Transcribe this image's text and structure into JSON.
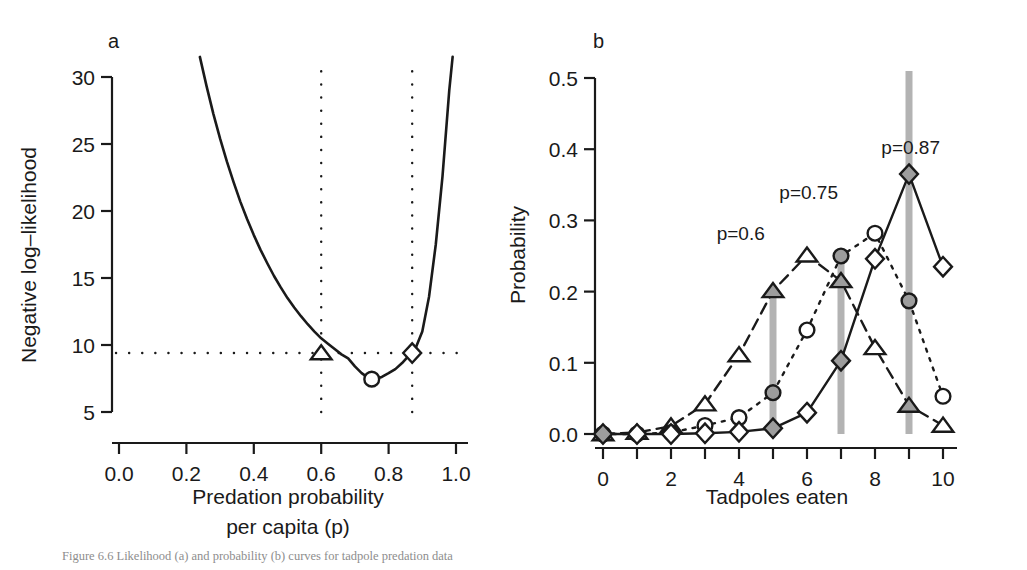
{
  "figure": {
    "caption": "Figure 6.6 Likelihood (a) and probability (b) curves for tadpole predation data",
    "panels": [
      "a",
      "b"
    ]
  },
  "panel_a": {
    "letter": "a",
    "ylabel": "Negative log–likelihood",
    "xlabel_line1": "Predation probability",
    "xlabel_line2": "per capita (p)",
    "xticks": [
      "0.0",
      "0.2",
      "0.4",
      "0.6",
      "0.8",
      "1.0"
    ],
    "yticks": [
      "5",
      "10",
      "15",
      "20",
      "25",
      "30"
    ]
  },
  "panel_b": {
    "letter": "b",
    "ylabel": "Probability",
    "xlabel": "Tadpoles eaten",
    "xticks": [
      "0",
      "1",
      "2",
      "3",
      "4",
      "5",
      "6",
      "7",
      "8",
      "9",
      "10"
    ],
    "xticks_labeled": [
      "0",
      "2",
      "4",
      "6",
      "8",
      "10"
    ],
    "yticks": [
      "0.0",
      "0.1",
      "0.2",
      "0.3",
      "0.4",
      "0.5"
    ],
    "annotations": [
      {
        "text": "p=0.6",
        "x": 4.05,
        "y": 0.272
      },
      {
        "text": "p=0.75",
        "x": 6.05,
        "y": 0.33
      },
      {
        "text": "p=0.87",
        "x": 9.05,
        "y": 0.393
      }
    ]
  },
  "chart_data": [
    {
      "type": "line",
      "id": "panel-a-likelihood-profile",
      "title": "a",
      "xlabel": "Predation probability per capita (p)",
      "ylabel": "Negative log-likelihood",
      "xlim": [
        0.0,
        1.0
      ],
      "ylim": [
        4.2,
        31.5
      ],
      "xticks": [
        0.0,
        0.2,
        0.4,
        0.6,
        0.8,
        1.0
      ],
      "yticks": [
        5,
        10,
        15,
        20,
        25,
        30
      ],
      "grid": false,
      "legend": "none",
      "curve": {
        "name": "Negative log-likelihood profile",
        "x": [
          0.24,
          0.26,
          0.28,
          0.3,
          0.32,
          0.34,
          0.36,
          0.38,
          0.4,
          0.42,
          0.44,
          0.46,
          0.48,
          0.5,
          0.52,
          0.54,
          0.56,
          0.58,
          0.6,
          0.62,
          0.64,
          0.66,
          0.68,
          0.7,
          0.72,
          0.74,
          0.75,
          0.76,
          0.78,
          0.8,
          0.82,
          0.84,
          0.86,
          0.87,
          0.88,
          0.9,
          0.92,
          0.94,
          0.96,
          0.98,
          0.99
        ],
        "y": [
          31.5,
          29.3,
          27.25,
          25.4,
          23.7,
          22.15,
          20.7,
          19.4,
          18.2,
          17.1,
          16.1,
          15.15,
          14.3,
          13.5,
          12.8,
          12.15,
          11.55,
          11.0,
          10.5,
          10.1,
          9.7,
          9.3,
          9.0,
          8.4,
          7.9,
          7.55,
          7.45,
          7.47,
          7.62,
          7.9,
          8.2,
          8.65,
          9.2,
          9.4,
          9.75,
          11.0,
          13.6,
          17.5,
          22.6,
          29.0,
          31.5
        ]
      },
      "reference_lines": {
        "horizontal_dotted": {
          "y": 9.4,
          "x_from": 0.0,
          "x_to": 1.0
        },
        "vertical_dotted": [
          {
            "x": 0.6
          },
          {
            "x": 0.87
          }
        ]
      },
      "markers": [
        {
          "shape": "triangle",
          "x": 0.6,
          "y": 9.4,
          "fill": "open"
        },
        {
          "shape": "circle",
          "x": 0.75,
          "y": 7.45,
          "fill": "open"
        },
        {
          "shape": "diamond",
          "x": 0.87,
          "y": 9.4,
          "fill": "open"
        }
      ]
    },
    {
      "type": "line",
      "id": "panel-b-binomial-distributions",
      "title": "b",
      "xlabel": "Tadpoles eaten",
      "ylabel": "Probability",
      "xlim": [
        -0.35,
        10.35
      ],
      "ylim": [
        -0.012,
        0.525
      ],
      "xticks": [
        0,
        1,
        2,
        3,
        4,
        5,
        6,
        7,
        8,
        9,
        10
      ],
      "yticks": [
        0.0,
        0.1,
        0.2,
        0.3,
        0.4,
        0.5
      ],
      "grid": false,
      "legend": "none",
      "categories": [
        0,
        1,
        2,
        3,
        4,
        5,
        6,
        7,
        8,
        9,
        10
      ],
      "series": [
        {
          "name": "p=0.6",
          "marker": "triangle",
          "linestyle": "dashed",
          "values": [
            0.0,
            0.002,
            0.011,
            0.042,
            0.111,
            0.201,
            0.251,
            0.215,
            0.121,
            0.04,
            0.012
          ],
          "highlight_x": 5,
          "highlight_value": 0.201
        },
        {
          "name": "p=0.75",
          "marker": "circle",
          "linestyle": "dotted",
          "values": [
            0.0,
            0.0,
            0.002,
            0.012,
            0.023,
            0.058,
            0.146,
            0.25,
            0.282,
            0.187,
            0.053
          ],
          "highlight_x": 7,
          "highlight_value": 0.25
        },
        {
          "name": "p=0.87",
          "marker": "diamond",
          "linestyle": "solid",
          "values": [
            0.0,
            0.0,
            0.0,
            0.001,
            0.003,
            0.008,
            0.03,
            0.103,
            0.246,
            0.365,
            0.235
          ],
          "highlight_x": 9,
          "highlight_value": 0.365
        }
      ],
      "highlight_bars": [
        {
          "x": 5,
          "y_top": 0.201,
          "color": "#b3b3b3"
        },
        {
          "x": 7,
          "y_top": 0.25,
          "color": "#b3b3b3"
        },
        {
          "x": 9,
          "y_top": 0.51,
          "color": "#b3b3b3"
        }
      ],
      "filled_markers": [
        {
          "series": "p=0.6",
          "x": 5,
          "y": 0.201
        },
        {
          "series": "p=0.75",
          "x": 5,
          "y": 0.058
        },
        {
          "series": "p=0.87",
          "x": 5,
          "y": 0.008
        },
        {
          "series": "p=0.6",
          "x": 7,
          "y": 0.215
        },
        {
          "series": "p=0.75",
          "x": 7,
          "y": 0.25
        },
        {
          "series": "p=0.87",
          "x": 7,
          "y": 0.103
        },
        {
          "series": "p=0.6",
          "x": 9,
          "y": 0.04
        },
        {
          "series": "p=0.75",
          "x": 9,
          "y": 0.187
        },
        {
          "series": "p=0.87",
          "x": 9,
          "y": 0.365
        },
        {
          "series": "p=0.6",
          "x": 0,
          "y": 0.0
        },
        {
          "series": "p=0.75",
          "x": 0,
          "y": 0.0
        },
        {
          "series": "p=0.87",
          "x": 0,
          "y": 0.0
        }
      ],
      "colors": {
        "line": "#1a1a1a",
        "bar": "#b3b3b3",
        "marker_fill": "#9d9d9d"
      }
    }
  ]
}
